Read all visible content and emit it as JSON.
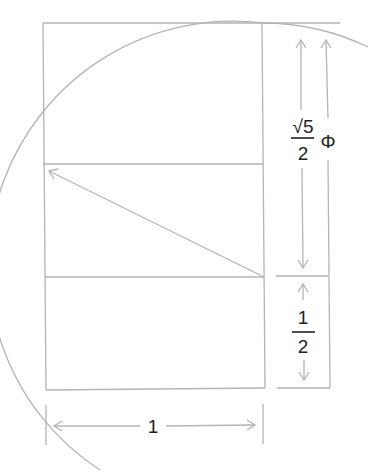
{
  "diagram": {
    "colors": {
      "line": "#b4b4b4",
      "text": "#222222",
      "background": "#ffffff"
    },
    "labels": {
      "sqrt5_over_2": {
        "numerator": "√5",
        "denominator": "2"
      },
      "phi": "Φ",
      "half": {
        "numerator": "1",
        "denominator": "2"
      },
      "unit_width": "1"
    },
    "shapes": {
      "unit_square_rows": 2,
      "description": "A 1 × 1/2 rectangle stacked in a golden rectangle; diagonal √5/2 swung as an arc to form Φ = 1/2 + √5/2"
    }
  }
}
